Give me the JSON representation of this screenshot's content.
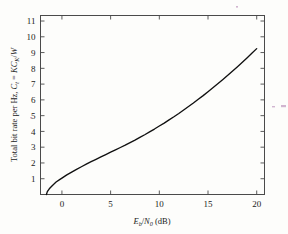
{
  "chart_data": {
    "type": "line",
    "title": "",
    "xlabel": "E_b/N_0 (dB)",
    "xlabel_parts": {
      "var1": "E",
      "sub1": "b",
      "slash": "/",
      "var2": "N",
      "sub2": "0",
      "unit": "(dB)"
    },
    "ylabel": "Total bit rate per Hz, C_t = KC_K/W",
    "ylabel_parts": {
      "lead": "Total bit rate per Hz, ",
      "var_c": "C",
      "sub_t": "t",
      "equals": " = ",
      "var_k1": "K",
      "var_c2": "C",
      "sub_k": "K",
      "slash": "/",
      "var_w": "W"
    },
    "xlim": [
      -2.2,
      20.8
    ],
    "ylim": [
      0,
      11.35
    ],
    "xticks": [
      0,
      5,
      10,
      15,
      20
    ],
    "yticks": [
      1,
      2,
      3,
      4,
      5,
      6,
      7,
      8,
      9,
      10,
      11
    ],
    "xtick_labels": [
      "0",
      "5",
      "10",
      "15",
      "20"
    ],
    "ytick_labels": [
      "1",
      "2",
      "3",
      "4",
      "5",
      "6",
      "7",
      "8",
      "9",
      "10",
      "11"
    ],
    "grid": false,
    "legend": null,
    "series": [
      {
        "name": "Shannon capacity",
        "x": [
          -1.59,
          -1.5,
          -1.3,
          -1.0,
          -0.6,
          -0.2,
          0.0,
          0.5,
          1.0,
          1.5,
          2.0,
          2.5,
          3.0,
          3.5,
          4.0,
          4.5,
          5.0,
          5.5,
          6.0,
          6.5,
          7.0,
          7.5,
          8.0,
          8.5,
          9.0,
          9.5,
          10.0,
          10.5,
          11.0,
          11.5,
          12.0,
          12.5,
          13.0,
          13.5,
          14.0,
          14.5,
          15.0,
          15.5,
          16.0,
          16.5,
          17.0,
          17.5,
          18.0,
          18.5,
          19.0,
          19.5,
          20.0
        ],
        "y": [
          0.0,
          0.18,
          0.36,
          0.56,
          0.79,
          0.96,
          1.04,
          1.24,
          1.42,
          1.59,
          1.76,
          1.92,
          2.08,
          2.23,
          2.38,
          2.53,
          2.68,
          2.83,
          2.98,
          3.13,
          3.29,
          3.45,
          3.62,
          3.79,
          3.97,
          4.15,
          4.34,
          4.53,
          4.73,
          4.93,
          5.14,
          5.36,
          5.58,
          5.8,
          6.04,
          6.27,
          6.52,
          6.77,
          7.02,
          7.28,
          7.55,
          7.82,
          8.09,
          8.37,
          8.66,
          8.95,
          9.25
        ]
      }
    ]
  },
  "figure": {
    "axis_color": "#4a4a4a",
    "curve_color": "#101010",
    "background": "#fdfdfb"
  }
}
